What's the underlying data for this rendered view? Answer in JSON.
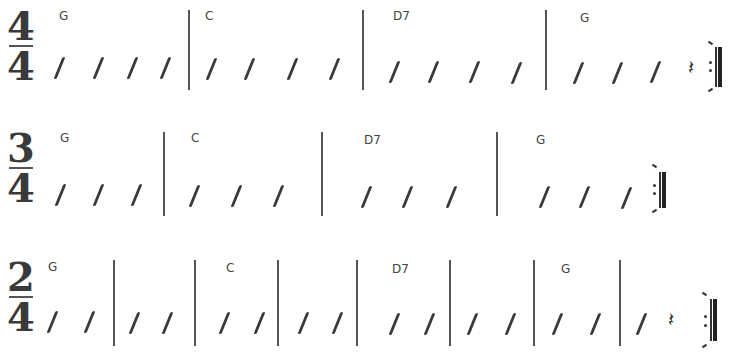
{
  "staves": [
    {
      "time_signature": {
        "top": "4",
        "bottom": "4"
      },
      "measures": [
        {
          "chord": "G",
          "beats": 4
        },
        {
          "chord": "C",
          "beats": 4
        },
        {
          "chord": "D7",
          "beats": 4
        },
        {
          "chord": "G",
          "beats": 3,
          "ends_with_rest": true
        }
      ],
      "ending": "repeat-end",
      "rest_glyph": "𝄽"
    },
    {
      "time_signature": {
        "top": "3",
        "bottom": "4"
      },
      "measures": [
        {
          "chord": "G",
          "beats": 3
        },
        {
          "chord": "C",
          "beats": 3
        },
        {
          "chord": "D7",
          "beats": 3
        },
        {
          "chord": "G",
          "beats": 3
        }
      ],
      "ending": "repeat-end"
    },
    {
      "time_signature": {
        "top": "2",
        "bottom": "4"
      },
      "measures": [
        {
          "chord": "G",
          "beats": 2
        },
        {
          "chord": "",
          "beats": 2
        },
        {
          "chord": "C",
          "beats": 2
        },
        {
          "chord": "",
          "beats": 2
        },
        {
          "chord": "D7",
          "beats": 2
        },
        {
          "chord": "",
          "beats": 2
        },
        {
          "chord": "G",
          "beats": 2
        },
        {
          "chord": "",
          "beats": 1,
          "ends_with_rest": true
        }
      ],
      "ending": "repeat-end",
      "rest_glyph": "𝄽"
    }
  ]
}
